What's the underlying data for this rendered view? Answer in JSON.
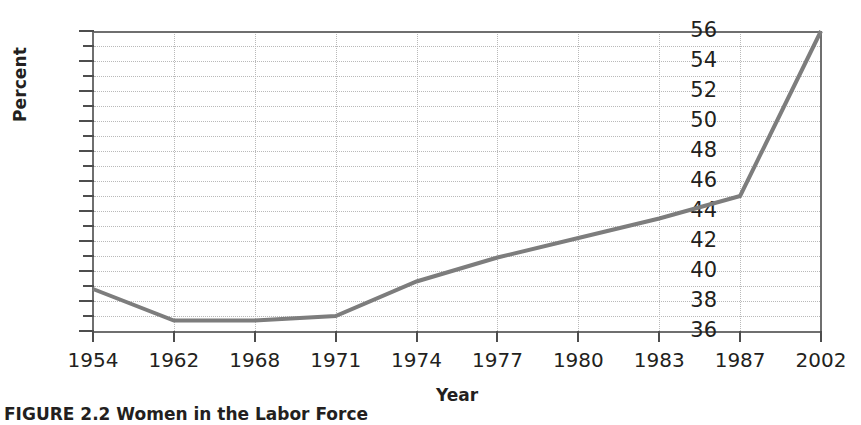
{
  "chart_data": {
    "type": "line",
    "title": "",
    "xlabel": "Year",
    "ylabel": "Percent",
    "categories": [
      "1954",
      "1962",
      "1968",
      "1971",
      "1974",
      "1977",
      "1980",
      "1983",
      "1987",
      "2002"
    ],
    "values": [
      38.8,
      36.7,
      36.7,
      37.0,
      39.3,
      40.9,
      42.2,
      43.5,
      45.0,
      56.0
    ],
    "series": [
      {
        "name": "Percent",
        "values": [
          38.8,
          36.7,
          36.7,
          37.0,
          39.3,
          40.9,
          42.2,
          43.5,
          45.0,
          56.0
        ]
      }
    ],
    "ylim": [
      36,
      56
    ],
    "ytick_step": 2,
    "yticks": [
      36,
      38,
      40,
      42,
      44,
      46,
      48,
      50,
      52,
      54,
      56
    ],
    "yticks_minor_step": 1,
    "grid": true,
    "grid_style": "dotted",
    "legend": "none",
    "x_axis_type": "categorical",
    "line_color": "#7d7d7d",
    "line_width": 4,
    "grid_color": "#b9b9b9",
    "axis_color": "#6f6f6f",
    "text_color": "#231f20",
    "background": "#ffffff"
  },
  "caption": {
    "text": "FIGURE 2.2  Women in the Labor Force"
  }
}
